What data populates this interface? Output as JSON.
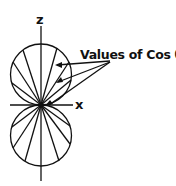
{
  "diagram": {
    "title": "",
    "axes": {
      "z_label": "z",
      "x_label": "x"
    },
    "callout": {
      "text": "Values of Cos θ"
    },
    "shape": "two tangent circular lobes along z-axis (polar plot of cos θ)",
    "colors": {
      "stroke": "#111111",
      "background": "#ffffff"
    }
  }
}
